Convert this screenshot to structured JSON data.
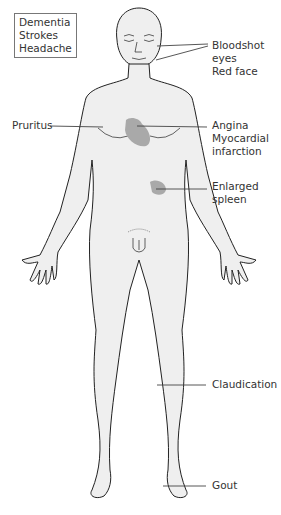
{
  "title_box": [
    "Dementia",
    "Strokes",
    "Headache"
  ],
  "labels": {
    "bloodshot": "Bloodshot\neyes",
    "red_face": "Red face",
    "pruritus": "Pruritus",
    "angina": "Angina\nMyocardial\ninfarction",
    "spleen": "Enlarged\nspleen",
    "claudication": "Claudication",
    "gout": "Gout"
  },
  "colors": {
    "skin": "#efefef",
    "outline": "#222222",
    "highlight": "#a9a9a9",
    "leader": "#444444"
  }
}
